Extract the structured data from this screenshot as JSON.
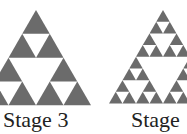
{
  "figure": {
    "fill_color": "#6b6b6b",
    "background": "#ffffff",
    "stages": [
      {
        "label": "Stage 3",
        "depth": 2,
        "apex": [
          36,
          10
        ],
        "side": 110,
        "label_x": 3
      },
      {
        "label": "Stage",
        "depth": 3,
        "apex": [
          163,
          10
        ],
        "side": 108,
        "label_x": 131
      }
    ]
  }
}
